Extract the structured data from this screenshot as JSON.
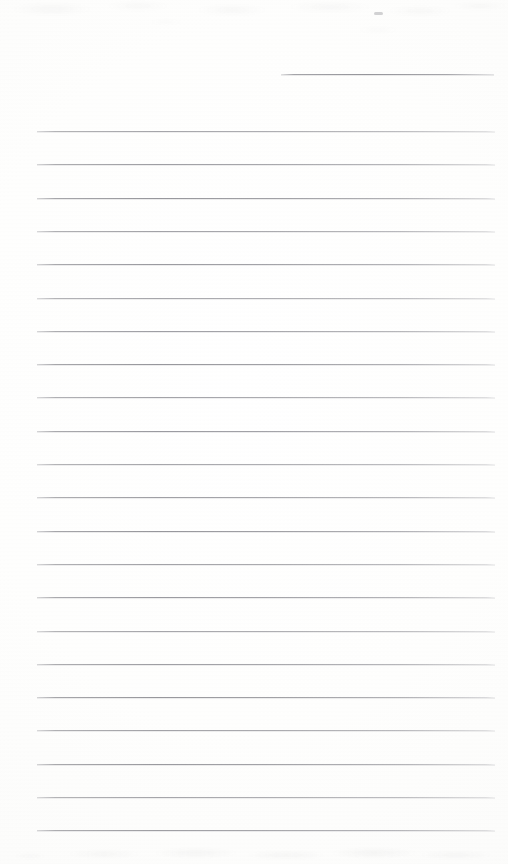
{
  "document": {
    "kind": "scanned-ruled-notepad-page",
    "title": "Blank ruled notepad page",
    "content_text": "",
    "page_width": 508,
    "page_height": 864,
    "paper_color": "#fdfdfc",
    "rule_color": "#7e7e85"
  },
  "ruling": {
    "line_spacing": 33.3,
    "full_rule_left": 37,
    "full_rule_right": 495,
    "first_full_rule_y": 131,
    "last_full_rule_y": 830,
    "full_rule_count": 22,
    "partial_rule": {
      "label": "top-right-partial-rule",
      "y": 74,
      "left": 281,
      "right": 494
    },
    "full_rule_y_positions": [
      131,
      164.3,
      197.6,
      230.9,
      264.2,
      297.5,
      330.8,
      364.1,
      397.4,
      430.7,
      464,
      497.3,
      530.6,
      563.9,
      597.2,
      630.5,
      663.8,
      697.1,
      730.4,
      763.7,
      797,
      830.3
    ]
  },
  "artifacts": {
    "top_smudge_label": "top-edge-scan-smudge",
    "bottom_smudge_label": "bottom-edge-scan-smudge",
    "fleck_label": "top-right-ink-fleck"
  }
}
